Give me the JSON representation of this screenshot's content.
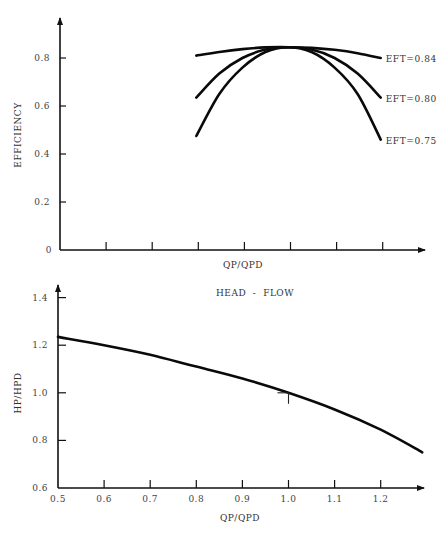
{
  "chart_data": [
    {
      "type": "line",
      "title": "",
      "xlabel": "QP/QPD",
      "ylabel": "EFFICIENCY",
      "ylim": [
        0,
        0.95
      ],
      "xlim": [
        0.5,
        1.3
      ],
      "grid": false,
      "y_ticks": [
        {
          "value": 0,
          "label": "0"
        },
        {
          "value": 0.2,
          "label": "0.2"
        },
        {
          "value": 0.4,
          "label": "0.4"
        },
        {
          "value": 0.6,
          "label": "0.6"
        },
        {
          "value": 0.8,
          "label": "0.8"
        }
      ],
      "x_ticks": [
        {
          "value": 0.6,
          "label": ""
        },
        {
          "value": 0.7,
          "label": ""
        },
        {
          "value": 0.8,
          "label": ""
        },
        {
          "value": 0.9,
          "label": ""
        },
        {
          "value": 1.0,
          "label": ""
        },
        {
          "value": 1.1,
          "label": ""
        },
        {
          "value": 1.2,
          "label": ""
        }
      ],
      "series": [
        {
          "name": "EFT=0.84",
          "x": [
            0.8,
            0.85,
            0.9,
            0.95,
            1.0,
            1.05,
            1.1,
            1.15,
            1.2
          ],
          "values": [
            0.81,
            0.825,
            0.837,
            0.844,
            0.845,
            0.842,
            0.834,
            0.82,
            0.8
          ]
        },
        {
          "name": "EFT=0.80",
          "x": [
            0.8,
            0.85,
            0.9,
            0.95,
            1.0,
            1.05,
            1.1,
            1.15,
            1.2
          ],
          "values": [
            0.635,
            0.735,
            0.8,
            0.835,
            0.845,
            0.835,
            0.8,
            0.735,
            0.635
          ]
        },
        {
          "name": "EFT=0.75",
          "x": [
            0.8,
            0.85,
            0.9,
            0.95,
            1.0,
            1.05,
            1.1,
            1.15,
            1.2
          ],
          "values": [
            0.475,
            0.65,
            0.76,
            0.825,
            0.845,
            0.825,
            0.76,
            0.65,
            0.46
          ]
        }
      ]
    },
    {
      "type": "line",
      "title": "HEAD  -  FLOW",
      "xlabel": "QP/QPD",
      "ylabel": "HP/HPD",
      "ylim": [
        0.6,
        1.45
      ],
      "xlim": [
        0.5,
        1.3
      ],
      "grid": false,
      "y_ticks": [
        {
          "value": 0.6,
          "label": "0.6"
        },
        {
          "value": 0.8,
          "label": "0.8"
        },
        {
          "value": 1.0,
          "label": "1.0"
        },
        {
          "value": 1.2,
          "label": "1.2"
        },
        {
          "value": 1.4,
          "label": "1.4"
        }
      ],
      "x_ticks": [
        {
          "value": 0.5,
          "label": "0.5"
        },
        {
          "value": 0.6,
          "label": "0.6"
        },
        {
          "value": 0.7,
          "label": "0.7"
        },
        {
          "value": 0.8,
          "label": "0.8"
        },
        {
          "value": 0.9,
          "label": "0.9"
        },
        {
          "value": 1.0,
          "label": "1.0"
        },
        {
          "value": 1.1,
          "label": "1.1"
        },
        {
          "value": 1.2,
          "label": "1.2"
        }
      ],
      "series": [
        {
          "name": "HEAD - FLOW",
          "x": [
            0.5,
            0.6,
            0.7,
            0.8,
            0.9,
            1.0,
            1.1,
            1.2,
            1.29
          ],
          "values": [
            1.235,
            1.2,
            1.16,
            1.11,
            1.06,
            1.0,
            0.93,
            0.845,
            0.75
          ]
        }
      ],
      "design_point": {
        "x": 1.0,
        "y": 1.0
      }
    }
  ],
  "caption": "Figure ... Pump characteristic curves"
}
